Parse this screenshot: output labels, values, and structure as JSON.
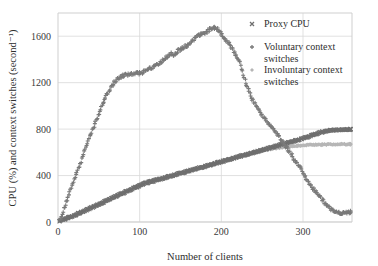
{
  "chart_data": {
    "type": "scatter",
    "title": "",
    "xlabel": "Number of clients",
    "ylabel": "CPU (%) and context switches (second⁻¹)",
    "xlim": [
      0,
      360
    ],
    "ylim": [
      0,
      1800
    ],
    "grid": true,
    "legend_position": "top-right",
    "xticks": [
      0,
      100,
      200,
      300
    ],
    "xtick_labels": [
      "0",
      "100",
      "200",
      "300"
    ],
    "yticks": [
      0,
      400,
      800,
      1200,
      1600
    ],
    "ytick_labels": [
      "0",
      "400",
      "800",
      "1200",
      "1600"
    ],
    "series": [
      {
        "name": "Proxy CPU",
        "marker": "x",
        "color": "#6f6f6f",
        "x": [
          2,
          6,
          10,
          14,
          18,
          22,
          26,
          30,
          34,
          38,
          42,
          46,
          50,
          54,
          58,
          62,
          66,
          70,
          74,
          78,
          82,
          86,
          90,
          94,
          98,
          102,
          106,
          110,
          114,
          118,
          122,
          126,
          130,
          134,
          138,
          142,
          146,
          150,
          154,
          158,
          162,
          166,
          170,
          174,
          178,
          182,
          186,
          190,
          194,
          198,
          202,
          206,
          210,
          214,
          218,
          222,
          226,
          230,
          234,
          238,
          242,
          246,
          250,
          254,
          258,
          262,
          266,
          270,
          274,
          278,
          282,
          286,
          290,
          294,
          298,
          302,
          306,
          310,
          314,
          318,
          322,
          326,
          330,
          334,
          338,
          342,
          346,
          350,
          354,
          358
        ],
        "y": [
          8,
          18,
          28,
          40,
          52,
          64,
          76,
          88,
          101,
          114,
          127,
          140,
          153,
          166,
          180,
          193,
          206,
          219,
          232,
          244,
          256,
          268,
          282,
          296,
          308,
          320,
          332,
          340,
          348,
          356,
          364,
          372,
          380,
          388,
          396,
          404,
          412,
          420,
          428,
          436,
          444,
          452,
          460,
          468,
          476,
          484,
          492,
          500,
          508,
          516,
          524,
          532,
          540,
          548,
          556,
          564,
          572,
          580,
          588,
          596,
          604,
          612,
          620,
          628,
          636,
          644,
          652,
          660,
          668,
          676,
          684,
          692,
          700,
          708,
          716,
          724,
          734,
          744,
          754,
          764,
          772,
          780,
          786,
          790,
          793,
          795,
          796,
          797,
          797,
          798
        ]
      },
      {
        "name": "Voluntary context switches",
        "marker": "+",
        "color": "#7a7a7a",
        "x": [
          2,
          6,
          10,
          14,
          18,
          22,
          26,
          30,
          34,
          38,
          42,
          46,
          50,
          54,
          58,
          62,
          66,
          70,
          74,
          78,
          82,
          86,
          90,
          94,
          98,
          102,
          106,
          110,
          114,
          118,
          122,
          126,
          130,
          134,
          138,
          142,
          146,
          150,
          154,
          158,
          162,
          166,
          170,
          174,
          178,
          182,
          186,
          190,
          194,
          198,
          202,
          206,
          210,
          214,
          218,
          222,
          226,
          230,
          234,
          238,
          242,
          246,
          250,
          254,
          258,
          262,
          266,
          270,
          274,
          278,
          282,
          286,
          290,
          294,
          298,
          302,
          306,
          310,
          314,
          318,
          322,
          326,
          330,
          334,
          338,
          342,
          346,
          350,
          354,
          358
        ],
        "y": [
          12,
          95,
          170,
          250,
          330,
          405,
          480,
          560,
          640,
          715,
          790,
          860,
          930,
          1000,
          1065,
          1120,
          1175,
          1210,
          1240,
          1255,
          1265,
          1270,
          1272,
          1275,
          1280,
          1285,
          1295,
          1310,
          1325,
          1345,
          1360,
          1380,
          1400,
          1425,
          1450,
          1440,
          1470,
          1490,
          1505,
          1520,
          1545,
          1575,
          1600,
          1615,
          1620,
          1630,
          1660,
          1680,
          1670,
          1640,
          1605,
          1565,
          1525,
          1480,
          1435,
          1390,
          1300,
          1200,
          1130,
          1060,
          1000,
          960,
          920,
          880,
          845,
          810,
          780,
          740,
          700,
          660,
          620,
          575,
          530,
          490,
          450,
          400,
          355,
          310,
          270,
          240,
          205,
          170,
          140,
          110,
          90,
          82,
          80,
          80,
          82,
          84
        ]
      },
      {
        "name": "Involuntary context switches",
        "marker": "diamond",
        "color": "#b6b6b6",
        "x": [
          2,
          6,
          10,
          14,
          18,
          22,
          26,
          30,
          34,
          38,
          42,
          46,
          50,
          54,
          58,
          62,
          66,
          70,
          74,
          78,
          82,
          86,
          90,
          94,
          98,
          102,
          106,
          110,
          114,
          118,
          122,
          126,
          130,
          134,
          138,
          142,
          146,
          150,
          154,
          158,
          162,
          166,
          170,
          174,
          178,
          182,
          186,
          190,
          194,
          198,
          202,
          206,
          210,
          214,
          218,
          222,
          226,
          230,
          234,
          238,
          242,
          246,
          250,
          254,
          258,
          262,
          266,
          270,
          274,
          278,
          282,
          286,
          290,
          294,
          298,
          302,
          306,
          310,
          314,
          318,
          322,
          326,
          330,
          334,
          338,
          342,
          346,
          350,
          354,
          358
        ],
        "y": [
          6,
          16,
          26,
          38,
          50,
          62,
          74,
          86,
          99,
          112,
          125,
          138,
          151,
          164,
          178,
          191,
          204,
          217,
          230,
          242,
          255,
          268,
          284,
          300,
          315,
          328,
          340,
          350,
          358,
          366,
          372,
          378,
          384,
          390,
          396,
          402,
          410,
          418,
          426,
          434,
          442,
          450,
          458,
          466,
          474,
          482,
          490,
          498,
          506,
          514,
          522,
          530,
          538,
          546,
          554,
          562,
          570,
          578,
          586,
          594,
          602,
          608,
          614,
          620,
          626,
          630,
          634,
          638,
          642,
          646,
          650,
          652,
          654,
          656,
          658,
          660,
          662,
          663,
          664,
          665,
          666,
          667,
          668,
          668,
          669,
          669,
          670,
          670,
          670,
          670
        ]
      }
    ]
  },
  "legend": {
    "items": [
      {
        "label": "Proxy CPU",
        "label2": ""
      },
      {
        "label": "Voluntary context",
        "label2": "switches"
      },
      {
        "label": "Involuntary context",
        "label2": "switches"
      }
    ]
  },
  "colors": {
    "proxy_cpu": "#6f6f6f",
    "voluntary": "#7a7a7a",
    "involuntary": "#b6b6b6",
    "grid": "#d9d9d9",
    "frame": "#cfcfcf",
    "text": "#2e2e2e"
  }
}
